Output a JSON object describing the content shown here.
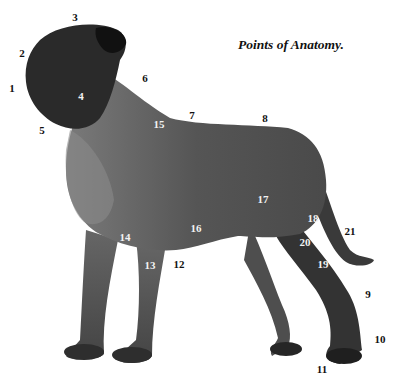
{
  "diagram": {
    "title": "Points of Anatomy.",
    "colors": {
      "body": "#5a5a5a",
      "head": "#2a2a2a",
      "text_dark": "#111111",
      "text_light": "#f2f2f2",
      "background": "#ffffff"
    },
    "points": [
      {
        "n": "1",
        "x": 12,
        "y": 88,
        "tone": "dark"
      },
      {
        "n": "2",
        "x": 22,
        "y": 53,
        "tone": "dark"
      },
      {
        "n": "3",
        "x": 75,
        "y": 17,
        "tone": "dark"
      },
      {
        "n": "4",
        "x": 81,
        "y": 96,
        "tone": "light"
      },
      {
        "n": "5",
        "x": 42,
        "y": 130,
        "tone": "dark"
      },
      {
        "n": "6",
        "x": 145,
        "y": 78,
        "tone": "dark"
      },
      {
        "n": "7",
        "x": 192,
        "y": 115,
        "tone": "dark"
      },
      {
        "n": "8",
        "x": 265,
        "y": 118,
        "tone": "dark"
      },
      {
        "n": "9",
        "x": 368,
        "y": 294,
        "tone": "dark"
      },
      {
        "n": "10",
        "x": 380,
        "y": 339,
        "tone": "dark"
      },
      {
        "n": "11",
        "x": 322,
        "y": 369,
        "tone": "dark"
      },
      {
        "n": "12",
        "x": 179,
        "y": 264,
        "tone": "dark"
      },
      {
        "n": "13",
        "x": 150,
        "y": 265,
        "tone": "light"
      },
      {
        "n": "14",
        "x": 125,
        "y": 237,
        "tone": "light"
      },
      {
        "n": "15",
        "x": 159,
        "y": 124,
        "tone": "light"
      },
      {
        "n": "16",
        "x": 196,
        "y": 228,
        "tone": "light"
      },
      {
        "n": "17",
        "x": 263,
        "y": 199,
        "tone": "light"
      },
      {
        "n": "18",
        "x": 313,
        "y": 218,
        "tone": "light"
      },
      {
        "n": "19",
        "x": 323,
        "y": 264,
        "tone": "light"
      },
      {
        "n": "20",
        "x": 305,
        "y": 242,
        "tone": "light"
      },
      {
        "n": "21",
        "x": 350,
        "y": 231,
        "tone": "dark"
      }
    ]
  }
}
